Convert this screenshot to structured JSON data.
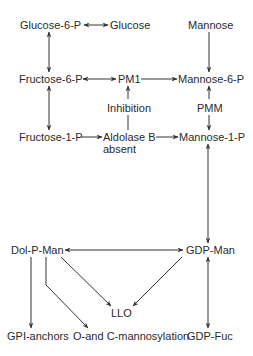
{
  "diagram": {
    "type": "metabolic-pathway",
    "colors": {
      "background": "#ffffff",
      "text": "#2a2a2a",
      "line": "#333333"
    },
    "nodes": {
      "glucose_6_p": "Glucose-6-P",
      "glucose": "Glucose",
      "mannose": "Mannose",
      "fructose_6_p": "Fructose-6-P",
      "pm1": "PM1",
      "mannose_6_p": "Mannose-6-P",
      "inhibition": "Inhibition",
      "pmm": "PMM",
      "fructose_1_p": "Fructose-1-P",
      "aldolase_b": "Aldolase B",
      "absent": "absent",
      "mannose_1_p": "Mannose-1-P",
      "dol_p_man": "Dol-P-Man",
      "gdp_man": "GDP-Man",
      "llo": "LLO",
      "gpi_anchors": "GPI-anchors",
      "o_c_mannosylation": "O-and C-mannosylation",
      "gdp_fuc": "GDP-Fuc"
    },
    "edges": [
      {
        "from": "Glucose-6-P",
        "to": "Glucose",
        "direction": "bidirectional"
      },
      {
        "from": "Glucose-6-P",
        "to": "Fructose-6-P",
        "direction": "bidirectional"
      },
      {
        "from": "Mannose",
        "to": "Mannose-6-P",
        "direction": "forward"
      },
      {
        "from": "Fructose-6-P",
        "to": "PM1",
        "direction": "bidirectional"
      },
      {
        "from": "PM1",
        "to": "Mannose-6-P",
        "direction": "forward"
      },
      {
        "from": "Inhibition",
        "to": "PM1",
        "direction": "forward"
      },
      {
        "from": "Aldolase B absent",
        "to": "Inhibition",
        "direction": "line"
      },
      {
        "from": "Fructose-6-P",
        "to": "Fructose-1-P",
        "direction": "bidirectional"
      },
      {
        "from": "Mannose-6-P",
        "to": "Mannose-1-P",
        "direction": "forward",
        "label": "PMM"
      },
      {
        "from": "Fructose-1-P",
        "to": "Aldolase B",
        "direction": "forward"
      },
      {
        "from": "Aldolase B",
        "to": "Mannose-1-P",
        "direction": "forward"
      },
      {
        "from": "Mannose-1-P",
        "to": "GDP-Man",
        "direction": "bidirectional"
      },
      {
        "from": "Dol-P-Man",
        "to": "GDP-Man",
        "direction": "bidirectional"
      },
      {
        "from": "Dol-P-Man",
        "to": "LLO",
        "direction": "forward"
      },
      {
        "from": "GDP-Man",
        "to": "LLO",
        "direction": "forward"
      },
      {
        "from": "Dol-P-Man",
        "to": "GPI-anchors",
        "direction": "forward"
      },
      {
        "from": "Dol-P-Man",
        "to": "O-and C-mannosylation",
        "direction": "forward"
      },
      {
        "from": "GDP-Man",
        "to": "GDP-Fuc",
        "direction": "bidirectional"
      }
    ]
  }
}
